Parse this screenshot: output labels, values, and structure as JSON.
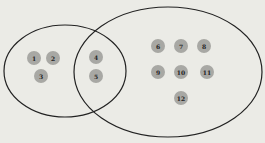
{
  "diagram": {
    "type": "venn",
    "sets": [
      {
        "name": "left-set",
        "cx": 65,
        "cy": 71,
        "rx": 61,
        "ry": 46
      },
      {
        "name": "right-set",
        "cx": 168,
        "cy": 72,
        "rx": 94,
        "ry": 65
      }
    ],
    "stroke_color": "#222222",
    "dot_color": "#a8a8a4",
    "elements": [
      {
        "label": "1",
        "x": 34,
        "y": 58,
        "region": "left-only"
      },
      {
        "label": "2",
        "x": 53,
        "y": 58,
        "region": "left-only"
      },
      {
        "label": "3",
        "x": 41,
        "y": 76,
        "region": "left-only"
      },
      {
        "label": "4",
        "x": 96,
        "y": 57,
        "region": "intersection"
      },
      {
        "label": "5",
        "x": 96,
        "y": 76,
        "region": "intersection"
      },
      {
        "label": "6",
        "x": 158,
        "y": 46,
        "region": "right-only"
      },
      {
        "label": "7",
        "x": 181,
        "y": 46,
        "region": "right-only"
      },
      {
        "label": "8",
        "x": 204,
        "y": 46,
        "region": "right-only"
      },
      {
        "label": "9",
        "x": 158,
        "y": 72,
        "region": "right-only"
      },
      {
        "label": "10",
        "x": 181,
        "y": 72,
        "region": "right-only"
      },
      {
        "label": "11",
        "x": 207,
        "y": 72,
        "region": "right-only"
      },
      {
        "label": "12",
        "x": 181,
        "y": 98,
        "region": "right-only"
      }
    ]
  }
}
